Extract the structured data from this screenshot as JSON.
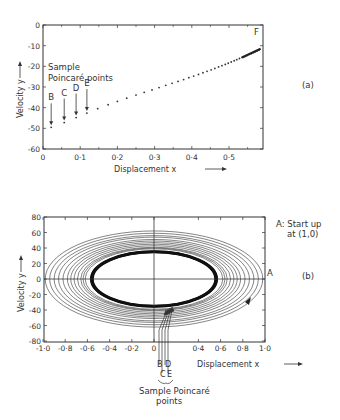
{
  "chart_data": [
    {
      "id": "a",
      "type": "scatter",
      "panel_label": "(a)",
      "title": "",
      "xlabel": "Displacement x",
      "ylabel": "Velocity y",
      "xlim": [
        0,
        0.6
      ],
      "ylim": [
        -60,
        0
      ],
      "x_ticks": [
        0,
        0.1,
        0.2,
        0.3,
        0.4,
        0.5
      ],
      "x_tick_labels": [
        "0",
        "0·1",
        "0·2",
        "0·3",
        "0·4",
        "0·5"
      ],
      "y_ticks": [
        0,
        -10,
        -20,
        -30,
        -40,
        -50,
        -60
      ],
      "y_tick_labels": [
        "0",
        "-10",
        "-20",
        "-30",
        "-40",
        "-50",
        "-60"
      ],
      "grid": false,
      "annotation_text": [
        "Sample",
        "Poincaré points"
      ],
      "end_label": "F",
      "marked_points": [
        {
          "label": "B",
          "x": 0.022,
          "y": -49.5
        },
        {
          "label": "C",
          "x": 0.057,
          "y": -47.2
        },
        {
          "label": "D",
          "x": 0.089,
          "y": -44.8
        },
        {
          "label": "E",
          "x": 0.118,
          "y": -42.6
        }
      ],
      "series": [
        {
          "name": "Poincaré points",
          "x": [
            0.022,
            0.057,
            0.089,
            0.118,
            0.147,
            0.175,
            0.2,
            0.225,
            0.25,
            0.272,
            0.293,
            0.312,
            0.33,
            0.347,
            0.363,
            0.378,
            0.392,
            0.405,
            0.418,
            0.43,
            0.441,
            0.452,
            0.462,
            0.472,
            0.481,
            0.49,
            0.498,
            0.506,
            0.514,
            0.521,
            0.528,
            0.535,
            0.542,
            0.548,
            0.554,
            0.56,
            0.566,
            0.571,
            0.576,
            0.58
          ],
          "y": [
            -49.5,
            -47.2,
            -44.8,
            -42.6,
            -40.5,
            -38.6,
            -37.0,
            -35.4,
            -33.9,
            -32.6,
            -31.4,
            -30.3,
            -29.2,
            -28.2,
            -27.3,
            -26.4,
            -25.5,
            -24.7,
            -23.9,
            -23.1,
            -22.4,
            -21.7,
            -21.0,
            -20.3,
            -19.7,
            -19.1,
            -18.5,
            -17.9,
            -17.3,
            -16.8,
            -16.2,
            -15.7,
            -15.2,
            -14.7,
            -14.2,
            -13.8,
            -13.3,
            -12.9,
            -12.5,
            -12.2
          ]
        }
      ]
    },
    {
      "id": "b",
      "type": "line",
      "panel_label": "(b)",
      "title": "",
      "xlabel": "Displacement x",
      "ylabel": "Velocity y",
      "xlim": [
        -1.0,
        1.0
      ],
      "ylim": [
        -80,
        80
      ],
      "x_ticks": [
        -1.0,
        -0.8,
        -0.6,
        -0.4,
        -0.2,
        0,
        0.4,
        0.6,
        0.8,
        1.0
      ],
      "x_tick_labels": [
        "-1·0",
        "-0·8",
        "-0·6",
        "-0·4",
        "-0·2",
        "0",
        "0·4",
        "0·6",
        "0·8",
        "1·0"
      ],
      "y_ticks": [
        80,
        60,
        40,
        20,
        0,
        -20,
        -40,
        -60,
        -80
      ],
      "y_tick_labels": [
        "80",
        "60",
        "40",
        "20",
        "0",
        "-20",
        "-40",
        "-60",
        "-80"
      ],
      "grid": false,
      "start_annotation": [
        "A: Start up",
        "at (1,0)"
      ],
      "start_point": {
        "label": "A",
        "x": 1.0,
        "y": 0
      },
      "limit_cycle": {
        "x_amplitude": 0.57,
        "y_amplitude": 36
      },
      "spiral_orbits": [
        {
          "x_amp": 0.98,
          "y_amp": 62
        },
        {
          "x_amp": 0.94,
          "y_amp": 59
        },
        {
          "x_amp": 0.9,
          "y_amp": 56
        },
        {
          "x_amp": 0.86,
          "y_amp": 54
        },
        {
          "x_amp": 0.82,
          "y_amp": 51
        },
        {
          "x_amp": 0.78,
          "y_amp": 49
        },
        {
          "x_amp": 0.75,
          "y_amp": 47
        },
        {
          "x_amp": 0.72,
          "y_amp": 45
        },
        {
          "x_amp": 0.69,
          "y_amp": 43
        },
        {
          "x_amp": 0.66,
          "y_amp": 41
        },
        {
          "x_amp": 0.64,
          "y_amp": 40
        },
        {
          "x_amp": 0.62,
          "y_amp": 39
        }
      ],
      "poincare_labels": [
        "B",
        "C",
        "D",
        "E"
      ],
      "poincare_caption": [
        "Sample Poincaré",
        "points"
      ]
    }
  ],
  "labels": {
    "a_panel": "(a)",
    "b_panel": "(b)",
    "xlabel": "Displacement  x",
    "ylabel": "Velocity  y",
    "sample_line1": "Sample",
    "sample_line2": "Poincaré  points",
    "end_F": "F",
    "start_A_line1": "A: Start up",
    "start_A_line2": "at (1,0)",
    "A": "A",
    "B": "B",
    "C": "C",
    "D": "D",
    "E": "E",
    "caption_b_line1": "Sample Poincaré",
    "caption_b_line2": "points"
  }
}
